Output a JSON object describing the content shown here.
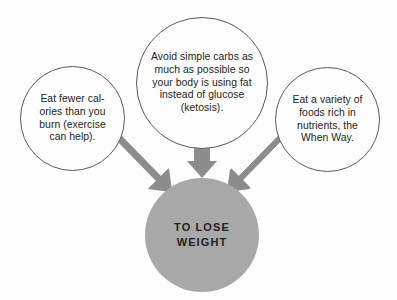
{
  "diagram": {
    "background_color": "#fdfdfd",
    "outline_color": "#58595b",
    "text_color": "#231f20",
    "arrow_color": "#8c8c8c",
    "target_fill_color": "#a8a8a8",
    "sources": [
      {
        "id": "left",
        "text": "Eat fewer cal-ories than you burn (exercise can help)."
      },
      {
        "id": "middle",
        "text": "Avoid simple carbs as much as possible so your body is using fat instead of glucose (ketosis)."
      },
      {
        "id": "right",
        "text": "Eat a variety of foods rich in nutrients, the When Way."
      }
    ],
    "target": {
      "id": "target",
      "text": "TO LOSE WEIGHT"
    },
    "arrows": [
      {
        "id": "left-to-target",
        "from": "left",
        "to": "target",
        "direction": "down-right"
      },
      {
        "id": "middle-to-target",
        "from": "middle",
        "to": "target",
        "direction": "down"
      },
      {
        "id": "right-to-target",
        "from": "right",
        "to": "target",
        "direction": "down-left"
      }
    ]
  }
}
